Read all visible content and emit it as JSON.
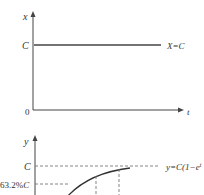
{
  "top_plot": {
    "y_axis_label": "x",
    "x_axis_label": "t",
    "origin_label": "0",
    "level_label": "C",
    "line_label": "X=C"
  },
  "bottom_plot": {
    "y_axis_label": "y",
    "level_label": "C",
    "percent_label_num": "63.2%",
    "percent_label_var": "C",
    "curve_label": "y=C(1−e",
    "curve_label_sup": "t"
  },
  "colors": {
    "line": "#444444",
    "dashed": "#777777",
    "text": "#333333"
  }
}
